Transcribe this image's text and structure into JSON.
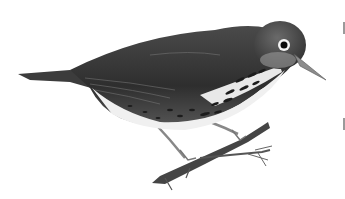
{
  "image": {
    "subject": "bird perched on branch",
    "style": "grayscale illustration",
    "background": "#ffffff",
    "colors": {
      "back": "#3a3a3a",
      "belly": "#f2f2f2",
      "spots": "#1a1a1a",
      "beak": "#8a8a8a",
      "branch": "#4a4a4a"
    }
  }
}
